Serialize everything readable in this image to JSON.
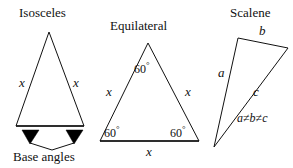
{
  "figure": {
    "background": "#ffffff",
    "stroke_color": "#111111",
    "marker_color": "#000000"
  },
  "isosceles": {
    "title": "Isosceles",
    "side_left_label": "x",
    "side_right_label": "x",
    "caption": "Base angles",
    "apex": {
      "x": 49,
      "y": 32
    },
    "base_left": {
      "x": 16,
      "y": 126
    },
    "base_right": {
      "x": 84,
      "y": 126
    },
    "marker_left": {
      "x": 30,
      "y": 137
    },
    "marker_right": {
      "x": 74,
      "y": 137
    },
    "pointer_vertex": {
      "x": 52,
      "y": 150
    }
  },
  "equilateral": {
    "title": "Equilateral",
    "angle_top": "60",
    "angle_left": "60",
    "angle_right": "60",
    "degree_symbol": "°",
    "side_left_label": "x",
    "side_right_label": "x",
    "base_label": "x",
    "apex": {
      "x": 148,
      "y": 43
    },
    "base_left": {
      "x": 100,
      "y": 141
    },
    "base_right": {
      "x": 199,
      "y": 141
    }
  },
  "scalene": {
    "title": "Scalene",
    "side_a_label": "a",
    "side_b_label": "b",
    "side_c_label": "c",
    "relation": "a ≠ b ≠ c",
    "relation_parts": {
      "a": "a",
      "ne1": "≠",
      "b": "b",
      "ne2": "≠",
      "c": "c"
    },
    "vertex_top_left": {
      "x": 238,
      "y": 38
    },
    "vertex_top_right": {
      "x": 288,
      "y": 48
    },
    "vertex_bottom": {
      "x": 214,
      "y": 147
    }
  }
}
